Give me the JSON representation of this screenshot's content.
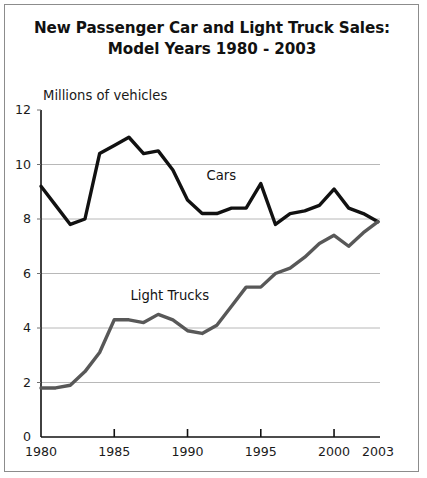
{
  "figure": {
    "title_line1": "New Passenger Car and Light Truck Sales:",
    "title_line2": "Model Years 1980 - 2003",
    "axis_note": "Millions of vehicles"
  },
  "chart_data": {
    "type": "line",
    "title": "New Passenger Car and Light Truck Sales: Model Years 1980 - 2003",
    "xlabel": "",
    "ylabel": "Millions of vehicles",
    "ylim": [
      0,
      12
    ],
    "xlim": [
      1980,
      2003
    ],
    "grid": "horizontal",
    "legend": "inline-annotations",
    "x": [
      1980,
      1981,
      1982,
      1983,
      1984,
      1985,
      1986,
      1987,
      1988,
      1989,
      1990,
      1991,
      1992,
      1993,
      1994,
      1995,
      1996,
      1997,
      1998,
      1999,
      2000,
      2001,
      2002,
      2003
    ],
    "ytick_labels": [
      "0",
      "2",
      "4",
      "6",
      "8",
      "10",
      "12"
    ],
    "ytick_values": [
      0,
      2,
      4,
      6,
      8,
      10,
      12
    ],
    "xtick_labels": [
      "1980",
      "1985",
      "1990",
      "1995",
      "2000",
      "2003"
    ],
    "xtick_values": [
      1980,
      1985,
      1990,
      1995,
      2000,
      2003
    ],
    "series": [
      {
        "name": "Cars",
        "color": "#111111",
        "width": 3.4,
        "label_x": 1991.3,
        "label_y": 9.55,
        "values": [
          9.2,
          8.5,
          7.8,
          8.0,
          10.4,
          10.7,
          11.0,
          10.4,
          10.5,
          9.8,
          8.7,
          8.2,
          8.2,
          8.4,
          8.4,
          9.3,
          7.8,
          8.2,
          8.3,
          8.5,
          9.1,
          8.4,
          8.2,
          7.9
        ]
      },
      {
        "name": "Light Trucks",
        "color": "#585858",
        "width": 3.4,
        "label_x": 1986.1,
        "label_y": 5.15,
        "values": [
          1.8,
          1.8,
          1.9,
          2.4,
          3.1,
          4.3,
          4.3,
          4.2,
          4.5,
          4.3,
          3.9,
          3.8,
          4.1,
          4.8,
          5.5,
          5.5,
          6.0,
          6.2,
          6.6,
          7.1,
          7.4,
          7.0,
          7.5,
          7.9
        ]
      }
    ]
  }
}
